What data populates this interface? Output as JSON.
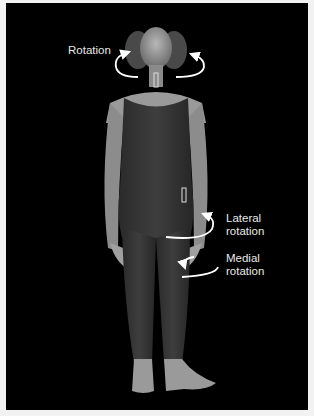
{
  "figure": {
    "labels": {
      "head": "Rotation",
      "hip_lateral_1": "Lateral",
      "hip_lateral_2": "rotation",
      "hip_medial_1": "Medial",
      "hip_medial_2": "rotation"
    },
    "colors": {
      "background": "#000000",
      "border": "#f2f2f2",
      "arrow": "#ffffff",
      "label_text": "#e8e8e8"
    }
  }
}
